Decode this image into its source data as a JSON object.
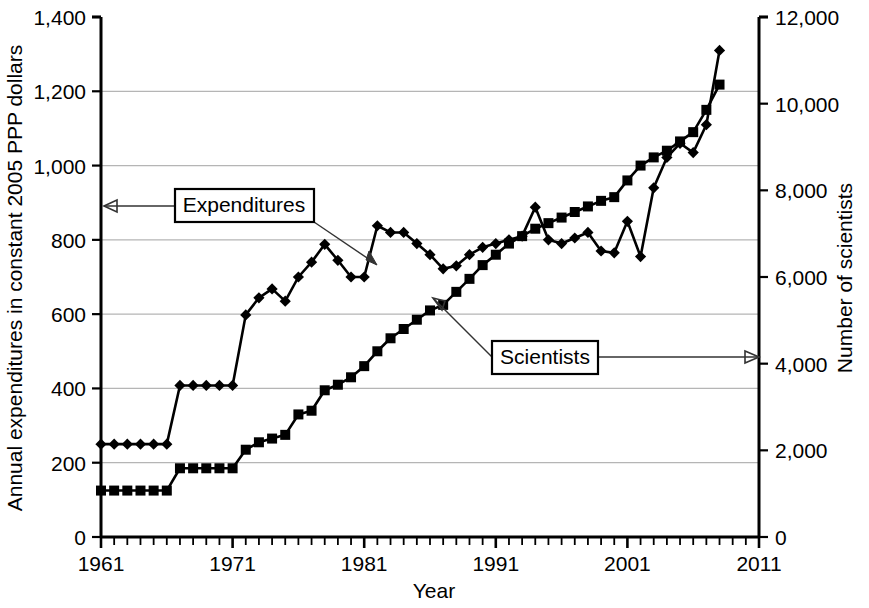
{
  "chart_data": {
    "type": "line",
    "title": "",
    "xlabel": "Year",
    "ylabel_left": "Annual expenditures in constant 2005 PPP dollars",
    "ylabel_right": "Number of scientists",
    "xlim": [
      1961,
      2011
    ],
    "xticks": [
      1961,
      1971,
      1981,
      1991,
      2001,
      2011
    ],
    "xtick_labels": [
      "1961",
      "1971",
      "1981",
      "1991",
      "2001",
      "2011"
    ],
    "x_minor_tick_step": 1,
    "ylim_left": [
      0,
      1400
    ],
    "yticks_left": [
      0,
      200,
      400,
      600,
      800,
      1000,
      1200,
      1400
    ],
    "ytick_labels_left": [
      "0",
      "200",
      "400",
      "600",
      "800",
      "1,000",
      "1,200",
      "1,400"
    ],
    "ylim_right": [
      0,
      12000
    ],
    "yticks_right": [
      0,
      2000,
      4000,
      6000,
      8000,
      10000,
      12000
    ],
    "ytick_labels_right": [
      "0",
      "2,000",
      "4,000",
      "6,000",
      "8,000",
      "10,000",
      "12,000"
    ],
    "grid": "horizontal",
    "legend_position": "inline-annotations",
    "series": [
      {
        "name": "Expenditures",
        "axis": "left",
        "marker": "diamond",
        "color": "#000000",
        "x": [
          1961,
          1962,
          1963,
          1964,
          1965,
          1966,
          1967,
          1968,
          1969,
          1970,
          1971,
          1972,
          1973,
          1974,
          1975,
          1976,
          1977,
          1978,
          1979,
          1980,
          1981,
          1982,
          1983,
          1984,
          1985,
          1986,
          1987,
          1988,
          1989,
          1990,
          1991,
          1992,
          1993,
          1994,
          1995,
          1996,
          1997,
          1998,
          1999,
          2000,
          2001,
          2002,
          2003,
          2004,
          2005,
          2006,
          2007,
          2008
        ],
        "values": [
          250,
          250,
          250,
          250,
          250,
          250,
          408,
          408,
          408,
          408,
          408,
          598,
          644,
          668,
          635,
          700,
          740,
          788,
          745,
          700,
          700,
          838,
          820,
          820,
          790,
          760,
          722,
          730,
          760,
          780,
          790,
          800,
          810,
          888,
          800,
          790,
          805,
          820,
          770,
          765,
          850,
          755,
          940,
          1022,
          1060,
          1035,
          1110,
          1310
        ]
      },
      {
        "name": "Scientists",
        "axis": "right",
        "marker": "square",
        "color": "#000000",
        "x": [
          1961,
          1962,
          1963,
          1964,
          1965,
          1966,
          1967,
          1968,
          1969,
          1970,
          1971,
          1972,
          1973,
          1974,
          1975,
          1976,
          1977,
          1978,
          1979,
          1980,
          1981,
          1982,
          1983,
          1984,
          1985,
          1986,
          1987,
          1988,
          1989,
          1990,
          1991,
          1992,
          1993,
          1994,
          1995,
          1996,
          1997,
          1998,
          1999,
          2000,
          2001,
          2002,
          2003,
          2004,
          2005,
          2006,
          2007,
          2008
        ],
        "values_left_scale": [
          125,
          125,
          125,
          125,
          125,
          125,
          185,
          185,
          185,
          185,
          185,
          235,
          255,
          265,
          275,
          330,
          340,
          395,
          410,
          430,
          460,
          500,
          535,
          560,
          585,
          610,
          625,
          660,
          695,
          732,
          760,
          790,
          810,
          830,
          845,
          860,
          875,
          890,
          905,
          915,
          960,
          1000,
          1022,
          1040,
          1065,
          1090,
          1150,
          1218
        ],
        "values_right_scale": [
          1071,
          1071,
          1071,
          1071,
          1071,
          1071,
          1586,
          1586,
          1586,
          1586,
          1586,
          2014,
          2186,
          2271,
          2357,
          2829,
          2914,
          3386,
          3514,
          3686,
          3943,
          4286,
          4586,
          4800,
          5014,
          5229,
          5357,
          5657,
          5957,
          6274,
          6514,
          6771,
          6943,
          7114,
          7243,
          7371,
          7500,
          7629,
          7757,
          7843,
          8229,
          8571,
          8757,
          8914,
          9129,
          9343,
          9857,
          10440
        ]
      }
    ],
    "annotations": [
      {
        "name": "Expenditures",
        "label": "Expenditures",
        "points_to": "left-axis"
      },
      {
        "name": "Scientists",
        "label": "Scientists",
        "points_to": "right-axis"
      }
    ]
  },
  "axes": {
    "x_title": "Year",
    "y_left_title": "Annual expenditures in constant 2005 PPP dollars",
    "y_right_title": "Number of scientists"
  },
  "colors": {
    "line": "#000000",
    "grid": "#b5b5b5",
    "axis": "#000000",
    "background": "#ffffff",
    "annotation_border": "#000000"
  }
}
